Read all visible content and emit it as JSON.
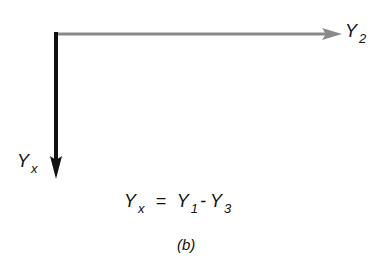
{
  "diagram": {
    "type": "vector-axes",
    "horizontal_axis": {
      "label_base": "Y",
      "label_sub": "2",
      "color": "#8a8a8a",
      "direction": "right"
    },
    "vertical_axis": {
      "label_base": "Y",
      "label_sub": "x",
      "color": "#111111",
      "direction": "down"
    },
    "equation": {
      "lhs_base": "Y",
      "lhs_sub": "x",
      "equals": "=",
      "t1_base": "Y",
      "t1_sub": "1",
      "minus": "-",
      "t2_base": "Y",
      "t2_sub": "3"
    },
    "caption": "(b)"
  }
}
